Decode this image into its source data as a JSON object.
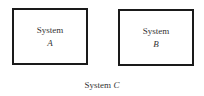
{
  "diagram": {
    "systems": [
      {
        "label": "System",
        "var": "A"
      },
      {
        "label": "System",
        "var": "B"
      }
    ],
    "outer": {
      "label": "System",
      "var": "C"
    }
  }
}
